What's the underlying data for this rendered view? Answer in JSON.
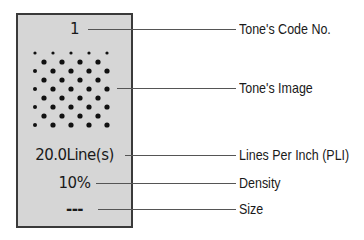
{
  "panel": {
    "code_no": "1",
    "lines": "20.0Line(s)",
    "density": "10%",
    "size": "---"
  },
  "labels": {
    "code_no": "Tone's Code No.",
    "image": "Tone's Image",
    "lpi": "Lines Per Inch (PLI)",
    "density": "Density",
    "size": "Size"
  },
  "colors": {
    "panel_bg": "#d6d6d6",
    "panel_border": "#3a3a3a",
    "dot": "#111111",
    "leader": "#555555"
  }
}
